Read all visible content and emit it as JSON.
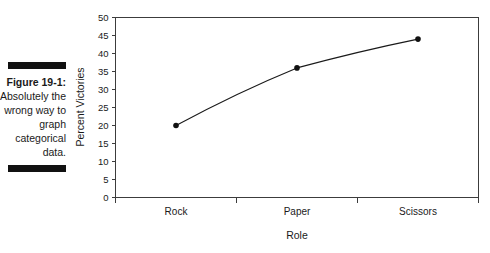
{
  "caption": {
    "figure_number": "Figure 19-1:",
    "description": "Absolutely the wrong way to graph categorical data.",
    "rule_color": "#111111"
  },
  "chart_data": {
    "type": "line",
    "title": "",
    "xlabel": "Role",
    "ylabel": "Percent Victories",
    "categories": [
      "Rock",
      "Paper",
      "Scissors"
    ],
    "values": [
      20,
      36,
      44
    ],
    "series": [
      {
        "name": "Percent Victories",
        "values": [
          20,
          36,
          44
        ]
      }
    ],
    "ylim": [
      0,
      50
    ],
    "yticks": [
      0,
      5,
      10,
      15,
      20,
      25,
      30,
      35,
      40,
      45,
      50
    ],
    "ytick_labels": [
      "0",
      "5",
      "10",
      "15",
      "20",
      "25",
      "30",
      "35",
      "40",
      "45",
      "50"
    ],
    "grid": false,
    "legend": false,
    "marker": "filled-circle",
    "line_color": "#1a1a1a",
    "marker_color": "#111111",
    "frame": "box",
    "background": "#ffffff"
  }
}
